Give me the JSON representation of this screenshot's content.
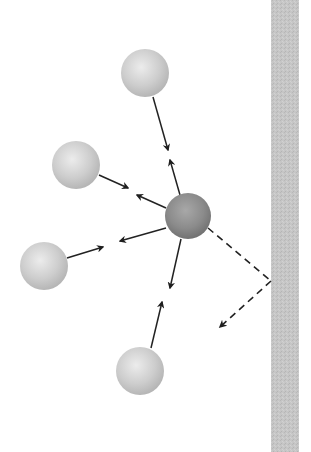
{
  "diagram": {
    "colors": {
      "background": "#ffffff",
      "wall": "#c4c4c4",
      "molecule_light": "#cfcfcf",
      "molecule_center": "#8e8e8e",
      "arrow": "#222222"
    },
    "wall": {
      "x": 271,
      "y": 0,
      "width": 28,
      "height": 452
    },
    "central_molecule": {
      "cx": 188,
      "cy": 216,
      "r": 23
    },
    "molecules": [
      {
        "name": "molecule-top",
        "cx": 145,
        "cy": 73,
        "r": 24
      },
      {
        "name": "molecule-upper-left",
        "cx": 76,
        "cy": 165,
        "r": 24
      },
      {
        "name": "molecule-left",
        "cx": 44,
        "cy": 266,
        "r": 24
      },
      {
        "name": "molecule-bottom",
        "cx": 140,
        "cy": 371,
        "r": 24
      }
    ],
    "arrows": [
      {
        "name": "arrow-top-to-center",
        "x1": 153,
        "y1": 97,
        "x2": 168,
        "y2": 150
      },
      {
        "name": "arrow-center-to-top",
        "x1": 180,
        "y1": 195,
        "x2": 170,
        "y2": 160
      },
      {
        "name": "arrow-upperleft-to-center",
        "x1": 99,
        "y1": 175,
        "x2": 128,
        "y2": 188
      },
      {
        "name": "arrow-center-to-upperleft",
        "x1": 166,
        "y1": 208,
        "x2": 137,
        "y2": 195
      },
      {
        "name": "arrow-left-to-center",
        "x1": 67,
        "y1": 258,
        "x2": 103,
        "y2": 247
      },
      {
        "name": "arrow-center-to-left",
        "x1": 166,
        "y1": 228,
        "x2": 120,
        "y2": 241
      },
      {
        "name": "arrow-center-to-bottom",
        "x1": 181,
        "y1": 239,
        "x2": 170,
        "y2": 288
      },
      {
        "name": "arrow-bottom-to-center",
        "x1": 151,
        "y1": 348,
        "x2": 162,
        "y2": 302
      }
    ],
    "dashed_path": {
      "name": "reflection-path",
      "points": [
        [
          208,
          228
        ],
        [
          271,
          281
        ],
        [
          220,
          327
        ]
      ]
    }
  }
}
